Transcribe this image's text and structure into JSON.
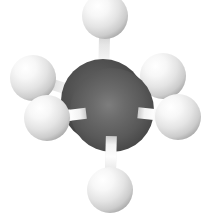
{
  "figure": {
    "title": "Eclipsed ethane ball-and-stick model",
    "molecule_name": "Ethane",
    "formula": "C2H6",
    "conformation": "eclipsed",
    "background_color": "#ffffff",
    "width": 211,
    "height": 221
  },
  "palette": {
    "carbon_base": "#5a5a5a",
    "carbon_dark": "#333333",
    "carbon_highlight": "#7b7b7b",
    "carbon_back_base": "#4d4d4d",
    "carbon_back_dark": "#2e2e2e",
    "hydrogen_base": "#e9e9e9",
    "hydrogen_highlight": "#ffffff",
    "hydrogen_shadow": "#b3b3b3",
    "bond_light": "#fbfbfb",
    "bond_base": "#e2e2e2",
    "bond_shadow": "#b6b6b6"
  },
  "atoms": [
    {
      "id": "C-back",
      "element": "C",
      "label": "carbon-back",
      "cx": 103,
      "cy": 101,
      "r": 42,
      "depth": "back"
    },
    {
      "id": "C-front",
      "element": "C",
      "label": "carbon-front",
      "cx": 112,
      "cy": 110,
      "r": 42,
      "depth": "front"
    },
    {
      "id": "H1",
      "element": "H",
      "label": "hydrogen-top",
      "cx": 105,
      "cy": 16,
      "r": 23,
      "depth": "back"
    },
    {
      "id": "H2",
      "element": "H",
      "label": "hydrogen-upper-left",
      "cx": 33,
      "cy": 78,
      "r": 23,
      "depth": "back"
    },
    {
      "id": "H3",
      "element": "H",
      "label": "hydrogen-upper-right",
      "cx": 163,
      "cy": 76,
      "r": 23,
      "depth": "back"
    },
    {
      "id": "H4",
      "element": "H",
      "label": "hydrogen-lower-left",
      "cx": 47,
      "cy": 118,
      "r": 23,
      "depth": "front"
    },
    {
      "id": "H5",
      "element": "H",
      "label": "hydrogen-lower-right",
      "cx": 178,
      "cy": 117,
      "r": 23,
      "depth": "front"
    },
    {
      "id": "H6",
      "element": "H",
      "label": "hydrogen-bottom",
      "cx": 110,
      "cy": 190,
      "r": 23,
      "depth": "front"
    }
  ],
  "bonds": [
    {
      "id": "B1",
      "label": "bond-carbon-back-hydrogen-top",
      "from": "C-back",
      "to": "H1",
      "width": 11,
      "depth": "back"
    },
    {
      "id": "B2",
      "label": "bond-carbon-back-hydrogen-upper-left",
      "from": "C-back",
      "to": "H2",
      "width": 11,
      "depth": "back"
    },
    {
      "id": "B3",
      "label": "bond-carbon-back-hydrogen-upper-right",
      "from": "C-back",
      "to": "H3",
      "width": 11,
      "depth": "back"
    },
    {
      "id": "B4",
      "label": "bond-carbon-front-hydrogen-lower-left",
      "from": "C-front",
      "to": "H4",
      "width": 11,
      "depth": "front"
    },
    {
      "id": "B5",
      "label": "bond-carbon-front-hydrogen-lower-right",
      "from": "C-front",
      "to": "H5",
      "width": 11,
      "depth": "front"
    },
    {
      "id": "B6",
      "label": "bond-carbon-front-hydrogen-bottom",
      "from": "C-front",
      "to": "H6",
      "width": 11,
      "depth": "front"
    }
  ]
}
